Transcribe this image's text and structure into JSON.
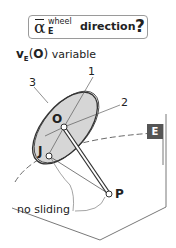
{
  "title": {
    "symbol": "α",
    "superscript": "wheel",
    "subscript": "E",
    "word": "direction",
    "question": "?"
  },
  "labels": {
    "velocity_v": "v",
    "velocity_sub": "E",
    "velocity_open": "(",
    "velocity_O": "O",
    "velocity_close": ")",
    "velocity_rest": " variable",
    "axis1": "1",
    "axis2": "2",
    "axis3": "3",
    "point_O": "O",
    "point_J": "J",
    "point_P": "P",
    "no_sliding": "no sliding",
    "frame_E": "E"
  },
  "colors": {
    "wheel_fill": "#d9d9d9",
    "stroke": "#333333",
    "frame_badge": "#555555"
  }
}
